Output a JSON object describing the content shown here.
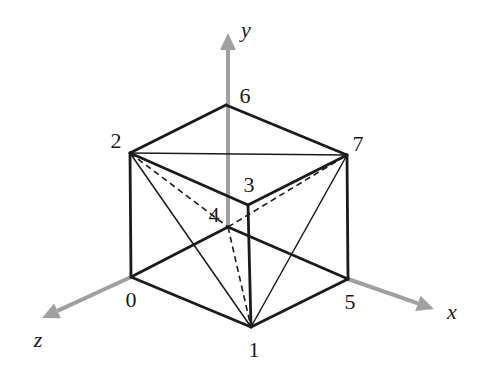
{
  "figure": {
    "colors": {
      "edge": "#1a1a1a",
      "axis": "#a0a0a0",
      "background": "#ffffff"
    },
    "axes": [
      {
        "name": "x",
        "label": "x",
        "from": [
          348,
          279
        ],
        "to": [
          434,
          309
        ],
        "label_pos": [
          452,
          312
        ]
      },
      {
        "name": "y",
        "label": "y",
        "from": [
          228,
          227
        ],
        "to": [
          228,
          33
        ],
        "label_pos": [
          246,
          30
        ]
      },
      {
        "name": "z",
        "label": "z",
        "from": [
          131,
          277
        ],
        "to": [
          42,
          318
        ],
        "label_pos": [
          38,
          340
        ]
      }
    ],
    "vertices": [
      {
        "id": "0",
        "label": "0",
        "pos": [
          131,
          277
        ],
        "label_pos": [
          131,
          300
        ]
      },
      {
        "id": "1",
        "label": "1",
        "pos": [
          251,
          327
        ],
        "label_pos": [
          254,
          350
        ]
      },
      {
        "id": "2",
        "label": "2",
        "pos": [
          130,
          153
        ],
        "label_pos": [
          116,
          141
        ]
      },
      {
        "id": "3",
        "label": "3",
        "pos": [
          248,
          205
        ],
        "label_pos": [
          249,
          185
        ]
      },
      {
        "id": "4",
        "label": "4",
        "pos": [
          228,
          227
        ],
        "label_pos": [
          214,
          215
        ]
      },
      {
        "id": "5",
        "label": "5",
        "pos": [
          348,
          279
        ],
        "label_pos": [
          350,
          302
        ]
      },
      {
        "id": "6",
        "label": "6",
        "pos": [
          226,
          105
        ],
        "label_pos": [
          245,
          96
        ]
      },
      {
        "id": "7",
        "label": "7",
        "pos": [
          347,
          155
        ],
        "label_pos": [
          358,
          144
        ]
      }
    ],
    "edges_solid_thick": [
      [
        "2",
        "6"
      ],
      [
        "6",
        "7"
      ],
      [
        "2",
        "3"
      ],
      [
        "3",
        "7"
      ],
      [
        "2",
        "0"
      ],
      [
        "3",
        "1"
      ],
      [
        "7",
        "5"
      ],
      [
        "0",
        "1"
      ],
      [
        "1",
        "5"
      ],
      [
        "0",
        "4"
      ],
      [
        "4",
        "5"
      ]
    ],
    "edges_solid_thin": [
      [
        "2",
        "7"
      ],
      [
        "2",
        "1"
      ],
      [
        "7",
        "1"
      ]
    ],
    "edges_dashed": [
      [
        "2",
        "4"
      ],
      [
        "4",
        "7"
      ],
      [
        "4",
        "1"
      ]
    ]
  }
}
